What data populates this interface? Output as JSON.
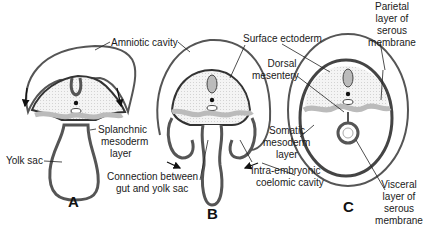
{
  "figure": {
    "panels": [
      {
        "letter": "A"
      },
      {
        "letter": "B"
      },
      {
        "letter": "C"
      }
    ],
    "labels": {
      "amniotic_cavity": "Amniotic cavity",
      "surface_ectoderm": "Surface ectoderm",
      "dorsal_mesentery_1": "Dorsal",
      "dorsal_mesentery_2": "mesentery",
      "parietal_1": "Parietal",
      "parietal_2": "layer of",
      "parietal_3": "serous",
      "parietal_4": "membrane",
      "splanchnic_1": "Splanchnic",
      "splanchnic_2": "mesoderm",
      "splanchnic_3": "layer",
      "yolk_sac": "Yolk sac",
      "connection_1": "Connection between",
      "connection_2": "gut and yolk sac",
      "somatic_1": "Somatic",
      "somatic_2": "mesoderm",
      "somatic_3": "layer",
      "intra_1": "Intra-embryonic",
      "intra_2": "coelomic cavity",
      "visceral_1": "Visceral",
      "visceral_2": "layer of",
      "visceral_3": "serous",
      "visceral_4": "membrane"
    },
    "colors": {
      "outline": "#3a3a3a",
      "mesoderm": "#bdbdbd",
      "fill": "#f2f2f2"
    }
  }
}
